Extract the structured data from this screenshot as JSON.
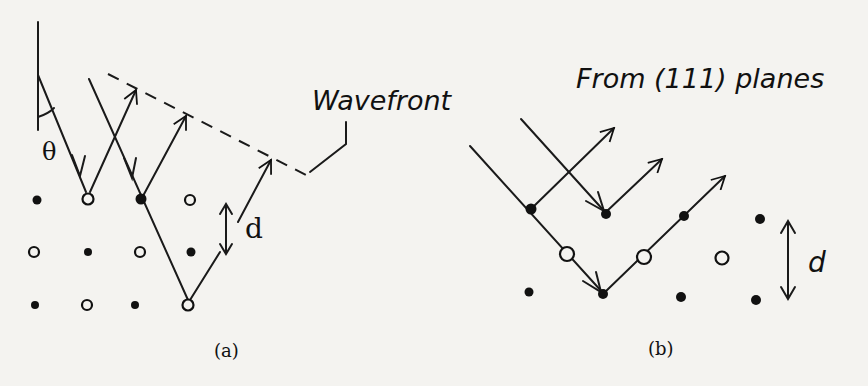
{
  "panel_a": {
    "caption": "(a)",
    "angle_label": "θ",
    "wavefront_label": "Wavefront",
    "spacing_label": "d"
  },
  "panel_b": {
    "caption": "(b)",
    "title": "From (111) planes",
    "spacing_label": "d"
  },
  "colors": {
    "background": "#f4f3f0",
    "ink": "#111111"
  }
}
